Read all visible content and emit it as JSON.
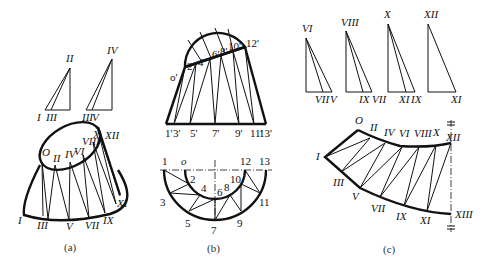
{
  "figure": {
    "panels": [
      {
        "id": "a",
        "caption": "(a)",
        "description": "Oblique truncated cone with triangulation lines; true-length triangles above",
        "true_length_triangles": [
          {
            "apex": "II",
            "base_labels": [
              "I",
              "III"
            ]
          },
          {
            "apex": "IV",
            "base_labels": [
              "III",
              "V"
            ]
          }
        ],
        "top_ellipse_labels": [
          "O",
          "II",
          "IV",
          "VI",
          "VIII",
          "X",
          "XII"
        ],
        "bottom_labels": [
          "I",
          "III",
          "V",
          "VII",
          "IX",
          "XI"
        ]
      },
      {
        "id": "b",
        "caption": "(b)",
        "description": "Front view (elevation) and top view (plan) of the surface with numbered division points",
        "front_view": {
          "top_labels": [
            "o'",
            "2'",
            "4'",
            "6'",
            "8'",
            "10'",
            "12'"
          ],
          "bottom_labels": [
            "1'",
            "3'",
            "5'",
            "7'",
            "9'",
            "11'",
            "13'"
          ]
        },
        "top_view": {
          "axis_labels": [
            "1",
            "o",
            "12",
            "13"
          ],
          "inner_labels": [
            "2",
            "4",
            "6",
            "8",
            "10"
          ],
          "outer_labels": [
            "3",
            "5",
            "7",
            "9",
            "11"
          ]
        }
      },
      {
        "id": "c",
        "caption": "(c)",
        "description": "Development (unfolded pattern) of half the surface, with true-length triangles above",
        "true_length_triangles": [
          {
            "apex": "VI",
            "base_labels": [
              "VII",
              "V"
            ]
          },
          {
            "apex": "VIII",
            "base_labels": [
              "IX",
              "VII"
            ]
          },
          {
            "apex": "X",
            "base_labels": [
              "XI",
              "IX"
            ]
          },
          {
            "apex": "XII",
            "base_labels": [
              "XI"
            ]
          }
        ],
        "top_edge_labels": [
          "O",
          "II",
          "IV",
          "VI",
          "VIII",
          "X",
          "XII"
        ],
        "left_label": "I",
        "bottom_edge_labels": [
          "III",
          "V",
          "VII",
          "IX",
          "XI",
          "XIII"
        ]
      }
    ]
  }
}
